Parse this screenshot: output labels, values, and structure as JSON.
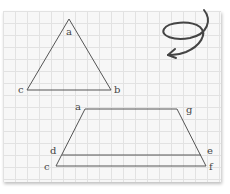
{
  "figure": {
    "triangle": {
      "vertices": [
        {
          "label": "a",
          "x": 69,
          "y": 19
        },
        {
          "label": "b",
          "x": 111,
          "y": 90
        },
        {
          "label": "c",
          "x": 27,
          "y": 90
        }
      ]
    },
    "quadrilateral": {
      "vertices": [
        {
          "label": "a",
          "x": 85,
          "y": 109
        },
        {
          "label": "g",
          "x": 177,
          "y": 109
        },
        {
          "label": "e",
          "x": 201,
          "y": 155
        },
        {
          "label": "d",
          "x": 62,
          "y": 155
        },
        {
          "label": "c",
          "x": 56,
          "y": 166
        },
        {
          "label": "f",
          "x": 206,
          "y": 166
        }
      ]
    },
    "labels": {
      "tri_a": "a",
      "tri_b": "b",
      "tri_c": "c",
      "quad_a": "a",
      "quad_g": "g",
      "quad_d": "d",
      "quad_e": "e",
      "quad_c": "c",
      "quad_f": "f"
    },
    "colors": {
      "line": "#555555",
      "arrow": "#444444",
      "grid": "#e2e2e2",
      "paper": "#f7f7f7"
    },
    "decoration": "spiral-arrow"
  }
}
